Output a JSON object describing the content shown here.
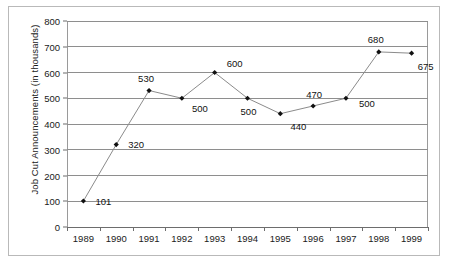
{
  "chart_data": {
    "type": "line",
    "title": "",
    "xlabel": "",
    "ylabel": "Job Cut Announcements  (in thousands)",
    "categories": [
      "1989",
      "1990",
      "1991",
      "1992",
      "1993",
      "1994",
      "1995",
      "1996",
      "1997",
      "1998",
      "1999"
    ],
    "values": [
      101,
      320,
      530,
      500,
      600,
      500,
      440,
      470,
      500,
      680,
      675
    ],
    "point_labels": [
      "101",
      "320",
      "530",
      "500",
      "600",
      "500",
      "440",
      "470",
      "500",
      "680",
      "675"
    ],
    "label_offsets": [
      {
        "dx": 20,
        "dy": 0
      },
      {
        "dx": 20,
        "dy": -1
      },
      {
        "dx": -3,
        "dy": -13
      },
      {
        "dx": 18,
        "dy": 10
      },
      {
        "dx": 20,
        "dy": -10
      },
      {
        "dx": 1,
        "dy": 13
      },
      {
        "dx": 18,
        "dy": 12
      },
      {
        "dx": 1,
        "dy": -12
      },
      {
        "dx": 21,
        "dy": 5
      },
      {
        "dx": -3,
        "dy": -13
      },
      {
        "dx": 14,
        "dy": 13
      }
    ],
    "ylim": [
      0,
      800
    ],
    "ytick_values": [
      0,
      100,
      200,
      300,
      400,
      500,
      600,
      700,
      800
    ],
    "ytick_labels": [
      "0",
      "100",
      "200",
      "300",
      "400",
      "500",
      "600",
      "700",
      "800"
    ],
    "grid": true,
    "legend": false,
    "marker": "diamond",
    "colors": {
      "line": "#8b8b8b",
      "marker": "#111111",
      "grid": "#8e8e8e",
      "axis": "#6d6d6d",
      "text": "#1a1a1a",
      "frame": "#b9b9b9"
    }
  }
}
